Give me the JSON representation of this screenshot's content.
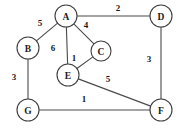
{
  "figure": {
    "kind": "weighted-undirected-graph",
    "width": 185,
    "height": 132,
    "background_color": "#ffffff",
    "node_fill_color": "#ffffff",
    "node_stroke_color": "#3d3d3d",
    "edge_color": "#4a4a4a",
    "text_color": "#1a1a1a"
  },
  "chart_data": {
    "type": "diagram",
    "title": "",
    "xlabel": "",
    "ylabel": "",
    "nodes": [
      {
        "id": "A",
        "label": "A",
        "x": 66,
        "y": 16,
        "r": 11
      },
      {
        "id": "B",
        "label": "B",
        "x": 28,
        "y": 48,
        "r": 11
      },
      {
        "id": "C",
        "label": "C",
        "x": 101,
        "y": 51,
        "r": 10
      },
      {
        "id": "D",
        "label": "D",
        "x": 161,
        "y": 16,
        "r": 11
      },
      {
        "id": "E",
        "label": "E",
        "x": 68,
        "y": 75,
        "r": 11
      },
      {
        "id": "F",
        "label": "F",
        "x": 161,
        "y": 110,
        "r": 11
      },
      {
        "id": "G",
        "label": "G",
        "x": 28,
        "y": 110,
        "r": 11
      }
    ],
    "edges": [
      {
        "from": "A",
        "to": "B",
        "weight": 5,
        "weight_label": "5",
        "label_x": 40,
        "label_y": 23
      },
      {
        "from": "A",
        "to": "D",
        "weight": 2,
        "weight_label": "2",
        "label_x": 118,
        "label_y": 8
      },
      {
        "from": "A",
        "to": "C",
        "weight": 4,
        "weight_label": "4",
        "label_x": 86,
        "label_y": 25
      },
      {
        "from": "A",
        "to": "E",
        "weight": 6,
        "weight_label": "6",
        "label_x": 53,
        "label_y": 48
      },
      {
        "from": "C",
        "to": "E",
        "weight": 1,
        "weight_label": "1",
        "label_x": 74,
        "label_y": 58
      },
      {
        "from": "B",
        "to": "G",
        "weight": 3,
        "weight_label": "3",
        "label_x": 14,
        "label_y": 77
      },
      {
        "from": "D",
        "to": "F",
        "weight": 3,
        "weight_label": "3",
        "label_x": 149,
        "label_y": 59
      },
      {
        "from": "E",
        "to": "F",
        "weight": 5,
        "weight_label": "5",
        "label_x": 108,
        "label_y": 79
      },
      {
        "from": "G",
        "to": "F",
        "weight": 1,
        "weight_label": "1",
        "label_x": 84,
        "label_y": 99
      }
    ]
  }
}
